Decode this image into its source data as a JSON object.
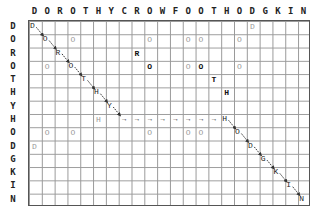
{
  "columns": [
    "D",
    "O",
    "R",
    "O",
    "T",
    "H",
    "Y",
    "C",
    "R",
    "O",
    "W",
    "F",
    "O",
    "O",
    "T",
    "H",
    "O",
    "D",
    "G",
    "K",
    "I",
    "N"
  ],
  "rows": [
    "D",
    "O",
    "R",
    "O",
    "T",
    "H",
    "Y",
    "H",
    "O",
    "D",
    "G",
    "K",
    "I",
    "N"
  ],
  "cells": [
    {
      "r": 0,
      "c": 0,
      "ch": "D",
      "style": "path"
    },
    {
      "r": 0,
      "c": 17,
      "ch": "D",
      "style": "grey"
    },
    {
      "r": 1,
      "c": 1,
      "ch": "O",
      "style": "path"
    },
    {
      "r": 1,
      "c": 3,
      "ch": "O",
      "style": "grey"
    },
    {
      "r": 1,
      "c": 9,
      "ch": "O",
      "style": "grey"
    },
    {
      "r": 1,
      "c": 12,
      "ch": "O",
      "style": "grey"
    },
    {
      "r": 1,
      "c": 13,
      "ch": "O",
      "style": "grey"
    },
    {
      "r": 1,
      "c": 16,
      "ch": "O",
      "style": "grey"
    },
    {
      "r": 2,
      "c": 2,
      "ch": "R",
      "style": "path"
    },
    {
      "r": 2,
      "c": 8,
      "ch": "R",
      "style": "bold"
    },
    {
      "r": 3,
      "c": 1,
      "ch": "O",
      "style": "grey"
    },
    {
      "r": 3,
      "c": 3,
      "ch": "O",
      "style": "path"
    },
    {
      "r": 3,
      "c": 9,
      "ch": "O",
      "style": "bold"
    },
    {
      "r": 3,
      "c": 12,
      "ch": "O",
      "style": "grey"
    },
    {
      "r": 3,
      "c": 13,
      "ch": "O",
      "style": "bold"
    },
    {
      "r": 3,
      "c": 16,
      "ch": "O",
      "style": "grey"
    },
    {
      "r": 4,
      "c": 4,
      "ch": "T",
      "style": "path"
    },
    {
      "r": 4,
      "c": 14,
      "ch": "T",
      "style": "bold"
    },
    {
      "r": 5,
      "c": 5,
      "ch": "H",
      "style": "path"
    },
    {
      "r": 5,
      "c": 15,
      "ch": "H",
      "style": "bold"
    },
    {
      "r": 6,
      "c": 6,
      "ch": "Y",
      "style": "path"
    },
    {
      "r": 7,
      "c": 5,
      "ch": "H",
      "style": "grey"
    },
    {
      "r": 7,
      "c": 15,
      "ch": "H",
      "style": "path"
    },
    {
      "r": 8,
      "c": 1,
      "ch": "O",
      "style": "grey"
    },
    {
      "r": 8,
      "c": 3,
      "ch": "O",
      "style": "grey"
    },
    {
      "r": 8,
      "c": 9,
      "ch": "O",
      "style": "grey"
    },
    {
      "r": 8,
      "c": 12,
      "ch": "O",
      "style": "grey"
    },
    {
      "r": 8,
      "c": 13,
      "ch": "O",
      "style": "grey"
    },
    {
      "r": 8,
      "c": 16,
      "ch": "O",
      "style": "path"
    },
    {
      "r": 9,
      "c": 0,
      "ch": "D",
      "style": "grey"
    },
    {
      "r": 9,
      "c": 17,
      "ch": "D",
      "style": "path"
    },
    {
      "r": 10,
      "c": 18,
      "ch": "G",
      "style": "path"
    },
    {
      "r": 11,
      "c": 19,
      "ch": "K",
      "style": "path"
    },
    {
      "r": 12,
      "c": 20,
      "ch": "I",
      "style": "path"
    },
    {
      "r": 13,
      "c": 21,
      "ch": "N",
      "style": "path"
    }
  ],
  "gap_arrows": {
    "row": 7,
    "from_col": 7,
    "to_col": 14,
    "glyph": "→"
  },
  "diag_arrows": [
    [
      0,
      0
    ],
    [
      1,
      1
    ],
    [
      2,
      2
    ],
    [
      3,
      3
    ],
    [
      4,
      4
    ],
    [
      5,
      5
    ],
    [
      6,
      6
    ],
    [
      7,
      15
    ],
    [
      8,
      16
    ],
    [
      9,
      17
    ],
    [
      10,
      18
    ],
    [
      11,
      19
    ],
    [
      12,
      20
    ]
  ]
}
